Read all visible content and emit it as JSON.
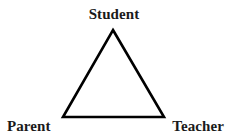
{
  "diagram": {
    "type": "triangle-relationship-diagram",
    "shape": {
      "name": "triangle",
      "stroke_color": "#000000",
      "stroke_width": 2.6,
      "fill": "none",
      "vertices": {
        "apex": {
          "x": 113,
          "y": 30
        },
        "bottom_left": {
          "x": 63,
          "y": 117
        },
        "bottom_right": {
          "x": 164,
          "y": 117
        }
      }
    },
    "nodes": [
      {
        "id": "student",
        "label": "Student",
        "position": "top"
      },
      {
        "id": "parent",
        "label": "Parent",
        "position": "bottom-left"
      },
      {
        "id": "teacher",
        "label": "Teacher",
        "position": "bottom-right"
      }
    ],
    "background_color": "#ffffff",
    "text_color": "#1a1a1a"
  }
}
